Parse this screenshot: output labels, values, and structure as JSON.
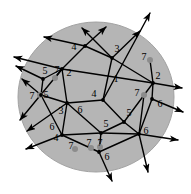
{
  "figure": {
    "type": "diagram",
    "width": 191,
    "height": 194,
    "background_color": "#ffffff",
    "disk": {
      "name": "shaded-disk",
      "center_x": 96,
      "center_y": 97,
      "radius_x": 78,
      "radius_y": 75,
      "fill_color": "#b5b5b5",
      "stroke_color": "#9a9a9a"
    },
    "colors": {
      "edge": "#000000",
      "vertex": "#000000",
      "marker_dot": "#8c8c8c",
      "label": "#000000",
      "disk_fill": "#b5b5b5"
    },
    "labels": [
      {
        "text": "4",
        "x": 74,
        "y": 47
      },
      {
        "text": "3",
        "x": 117,
        "y": 49
      },
      {
        "text": "7",
        "x": 144,
        "y": 57
      },
      {
        "text": "5",
        "x": 45,
        "y": 71
      },
      {
        "text": "7",
        "x": 57,
        "y": 70
      },
      {
        "text": "2",
        "x": 69,
        "y": 73
      },
      {
        "text": "1",
        "x": 116,
        "y": 79
      },
      {
        "text": "2",
        "x": 158,
        "y": 76
      },
      {
        "text": "7",
        "x": 32,
        "y": 96
      },
      {
        "text": "5",
        "x": 46,
        "y": 95
      },
      {
        "text": "4",
        "x": 94,
        "y": 94
      },
      {
        "text": "7",
        "x": 137,
        "y": 93
      },
      {
        "text": "6",
        "x": 160,
        "y": 104
      },
      {
        "text": "3",
        "x": 61,
        "y": 111
      },
      {
        "text": "6",
        "x": 80,
        "y": 110
      },
      {
        "text": "5",
        "x": 129,
        "y": 113
      },
      {
        "text": "6",
        "x": 52,
        "y": 127
      },
      {
        "text": "5",
        "x": 106,
        "y": 124
      },
      {
        "text": "6",
        "x": 146,
        "y": 131
      },
      {
        "text": "4",
        "x": 56,
        "y": 138
      },
      {
        "text": "7",
        "x": 71,
        "y": 146
      },
      {
        "text": "7",
        "x": 89,
        "y": 143
      },
      {
        "text": "7",
        "x": 100,
        "y": 143
      },
      {
        "text": "6",
        "x": 107,
        "y": 157
      }
    ],
    "vertices": [
      {
        "name": "vertex-a",
        "x": 62,
        "y": 69
      },
      {
        "name": "vertex-b",
        "x": 112,
        "y": 58
      },
      {
        "name": "vertex-c",
        "x": 153,
        "y": 83
      },
      {
        "name": "vertex-d",
        "x": 85,
        "y": 46
      },
      {
        "name": "vertex-e",
        "x": 43,
        "y": 79
      },
      {
        "name": "vertex-f",
        "x": 41,
        "y": 95
      },
      {
        "name": "vertex-g",
        "x": 67,
        "y": 103
      },
      {
        "name": "vertex-h",
        "x": 103,
        "y": 100
      },
      {
        "name": "vertex-i",
        "x": 124,
        "y": 122
      },
      {
        "name": "vertex-j",
        "x": 101,
        "y": 133
      },
      {
        "name": "vertex-k",
        "x": 139,
        "y": 134
      },
      {
        "name": "vertex-l",
        "x": 152,
        "y": 99
      },
      {
        "name": "vertex-m",
        "x": 62,
        "y": 135
      },
      {
        "name": "vertex-n",
        "x": 99,
        "y": 152
      }
    ],
    "marker_dots": [
      {
        "name": "marker-dot-1",
        "x": 55,
        "y": 78,
        "r": 3
      },
      {
        "name": "marker-dot-2",
        "x": 40,
        "y": 95,
        "r": 3
      },
      {
        "name": "marker-dot-3",
        "x": 150,
        "y": 60,
        "r": 3
      },
      {
        "name": "marker-dot-4",
        "x": 144,
        "y": 95,
        "r": 3
      },
      {
        "name": "marker-dot-5",
        "x": 75,
        "y": 149,
        "r": 3
      },
      {
        "name": "marker-dot-6",
        "x": 91,
        "y": 148,
        "r": 3
      },
      {
        "name": "marker-dot-7",
        "x": 100,
        "y": 147,
        "r": 3
      }
    ],
    "arrow_count": 16,
    "label_values": [
      "1",
      "2",
      "3",
      "4",
      "5",
      "6",
      "7"
    ]
  }
}
